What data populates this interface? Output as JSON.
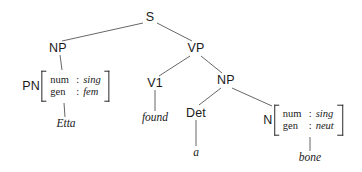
{
  "diagram": {
    "type": "constituency-tree",
    "sentence": "Etta found a bone",
    "line_color": "#555555",
    "text_color": "#1a1a1a",
    "background": "#ffffff"
  },
  "nodes": {
    "s": {
      "label": "S",
      "x": 150,
      "y": 17
    },
    "np_subject": {
      "label": "NP",
      "x": 58,
      "y": 48
    },
    "vp": {
      "label": "VP",
      "x": 196,
      "y": 48
    },
    "v1": {
      "label": "V1",
      "x": 155,
      "y": 83
    },
    "np_object": {
      "label": "NP",
      "x": 226,
      "y": 80
    },
    "det": {
      "label": "Det",
      "x": 196,
      "y": 113
    }
  },
  "matrices": {
    "pn": {
      "category": "PN",
      "x": 66,
      "y": 86,
      "rows": [
        {
          "attribute": "num",
          "separator": ":",
          "value": "sing"
        },
        {
          "attribute": "gen",
          "separator": ":",
          "value": "fem"
        }
      ]
    },
    "n": {
      "category": "N",
      "x": 303,
      "y": 120,
      "rows": [
        {
          "attribute": "num",
          "separator": ":",
          "value": "sing"
        },
        {
          "attribute": "gen",
          "separator": ":",
          "value": "neut"
        }
      ]
    }
  },
  "terminals": {
    "etta": {
      "text": "Etta",
      "x": 66,
      "y": 124
    },
    "found": {
      "text": "found",
      "x": 155,
      "y": 118
    },
    "a": {
      "text": "a",
      "x": 196,
      "y": 153
    },
    "bone": {
      "text": "bone",
      "x": 310,
      "y": 158
    }
  },
  "edges": [
    {
      "from": "s",
      "to": "np_subject",
      "x1": 143,
      "y1": 23,
      "x2": 62,
      "y2": 41
    },
    {
      "from": "s",
      "to": "vp",
      "x1": 157,
      "y1": 23,
      "x2": 192,
      "y2": 41
    },
    {
      "from": "np_subject",
      "to": "pn_matrix",
      "x1": 60,
      "y1": 55,
      "x2": 62,
      "y2": 70
    },
    {
      "from": "pn_matrix",
      "to": "etta",
      "x1": 64,
      "y1": 103,
      "x2": 65,
      "y2": 117
    },
    {
      "from": "vp",
      "to": "v1",
      "x1": 190,
      "y1": 56,
      "x2": 159,
      "y2": 76
    },
    {
      "from": "vp",
      "to": "np_object",
      "x1": 201,
      "y1": 56,
      "x2": 222,
      "y2": 73
    },
    {
      "from": "v1",
      "to": "found",
      "x1": 155,
      "y1": 90,
      "x2": 155,
      "y2": 111
    },
    {
      "from": "np_object",
      "to": "det",
      "x1": 221,
      "y1": 88,
      "x2": 199,
      "y2": 105
    },
    {
      "from": "np_object",
      "to": "n_matrix",
      "x1": 232,
      "y1": 88,
      "x2": 272,
      "y2": 106
    },
    {
      "from": "det",
      "to": "a",
      "x1": 196,
      "y1": 120,
      "x2": 196,
      "y2": 146
    },
    {
      "from": "n_matrix",
      "to": "bone",
      "x1": 310,
      "y1": 137,
      "x2": 310,
      "y2": 151
    }
  ]
}
